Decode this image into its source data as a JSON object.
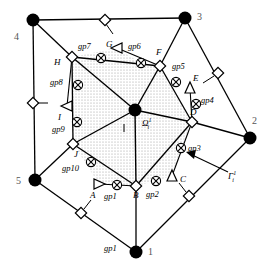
{
  "figure": {
    "type": "mesh-diagram"
  },
  "outer_vertices": [
    {
      "id": "v1",
      "label": "1",
      "x": 136,
      "y": 252,
      "lx": 148,
      "ly": 253
    },
    {
      "id": "v2",
      "label": "2",
      "x": 250,
      "y": 138,
      "lx": 252,
      "ly": 122
    },
    {
      "id": "v3",
      "label": "3",
      "x": 185,
      "y": 18,
      "lx": 197,
      "ly": 18
    },
    {
      "id": "v4",
      "label": "4",
      "x": 33,
      "y": 20,
      "lx": 18,
      "ly": 38
    },
    {
      "id": "v5",
      "label": "5",
      "x": 35,
      "y": 180,
      "lx": 20,
      "ly": 182
    }
  ],
  "center_node": {
    "id": "center",
    "x": 135,
    "y": 110
  },
  "center_label": {
    "text": "Ω",
    "sub": "i",
    "sup": "1",
    "x": 144,
    "y": 125
  },
  "center_tick_label": {
    "text": "ı",
    "x": 124,
    "y": 128
  },
  "bottom_gp_label": {
    "text": "gp1",
    "x": 108,
    "y": 248
  },
  "gamma_label": {
    "text": "Γ",
    "sub": "i",
    "sup": "1",
    "x": 232,
    "y": 176
  },
  "inner_diamonds": [
    {
      "id": "H",
      "label": "H",
      "x": 72,
      "y": 57,
      "lx": 57,
      "ly": 64
    },
    {
      "id": "F",
      "label": "F",
      "x": 160,
      "y": 66,
      "lx": 158,
      "ly": 54
    },
    {
      "id": "D",
      "label": "D",
      "x": 192,
      "y": 122,
      "lx": 192,
      "ly": 113
    },
    {
      "id": "B",
      "label": "B",
      "x": 136,
      "y": 186,
      "lx": 136,
      "ly": 197
    },
    {
      "id": "J",
      "label": "J",
      "x": 73,
      "y": 144,
      "lx": 75,
      "ly": 160
    }
  ],
  "triangles": [
    {
      "id": "A",
      "label": "A",
      "x": 99,
      "y": 184,
      "lx": 95,
      "ly": 197,
      "rot": 90
    },
    {
      "id": "C",
      "label": "C",
      "x": 172,
      "y": 176,
      "lx": 182,
      "ly": 180,
      "rot": 0
    },
    {
      "id": "E",
      "label": "E",
      "x": 190,
      "y": 88,
      "lx": 194,
      "ly": 79,
      "rot": 0
    },
    {
      "id": "G",
      "label": "G",
      "x": 117,
      "y": 48,
      "lx": 106,
      "ly": 46,
      "rot": 270
    },
    {
      "id": "I",
      "label": "I",
      "x": 67,
      "y": 106,
      "lx": 60,
      "ly": 121,
      "rot": 270
    }
  ],
  "gauss_points": [
    {
      "id": "gp1",
      "label": "gp1",
      "x": 117,
      "y": 185,
      "lx": 109,
      "ly": 198
    },
    {
      "id": "gp2",
      "label": "gp2",
      "x": 156,
      "y": 181,
      "lx": 150,
      "ly": 197
    },
    {
      "id": "gp3",
      "label": "gp3",
      "x": 181,
      "y": 148,
      "lx": 190,
      "ly": 152
    },
    {
      "id": "gp4",
      "label": "gp4",
      "x": 196,
      "y": 104,
      "lx": 202,
      "ly": 102
    },
    {
      "id": "gp5",
      "label": "gp5",
      "x": 176,
      "y": 82,
      "lx": 178,
      "ly": 67
    },
    {
      "id": "gp6",
      "label": "gp6",
      "x": 141,
      "y": 63,
      "lx": 131,
      "ly": 48
    },
    {
      "id": "gp7",
      "label": "gp7",
      "x": 101,
      "y": 58,
      "lx": 80,
      "ly": 47
    },
    {
      "id": "gp8",
      "label": "gp8",
      "x": 78,
      "y": 85,
      "lx": 52,
      "ly": 83
    },
    {
      "id": "gp9",
      "label": "gp9",
      "x": 77,
      "y": 122,
      "lx": 55,
      "ly": 131
    },
    {
      "id": "gp10",
      "label": "gp10",
      "x": 91,
      "y": 162,
      "lx": 68,
      "ly": 170
    }
  ],
  "edge_markers": [
    {
      "id": "em-top",
      "x": 105,
      "y": 20,
      "tick": [
        112,
        32
      ]
    },
    {
      "id": "em-left",
      "x": 33,
      "y": 103,
      "tick": [
        46,
        103
      ]
    },
    {
      "id": "em-right-top",
      "x": 218,
      "y": 73,
      "tick": [
        205,
        82
      ]
    },
    {
      "id": "em-bottom-left",
      "x": 81,
      "y": 213,
      "tick": [
        89,
        203
      ]
    },
    {
      "id": "em-bottom-right",
      "x": 189,
      "y": 196,
      "tick": [
        180,
        186
      ]
    }
  ],
  "arrow": {
    "from_x": 228,
    "from_y": 172,
    "to_x": 186,
    "to_y": 152
  },
  "colors": {
    "line": "#000000",
    "fill_region": "#d8d8d8",
    "node": "#000000",
    "background": "#ffffff",
    "number_text": "#555555"
  }
}
